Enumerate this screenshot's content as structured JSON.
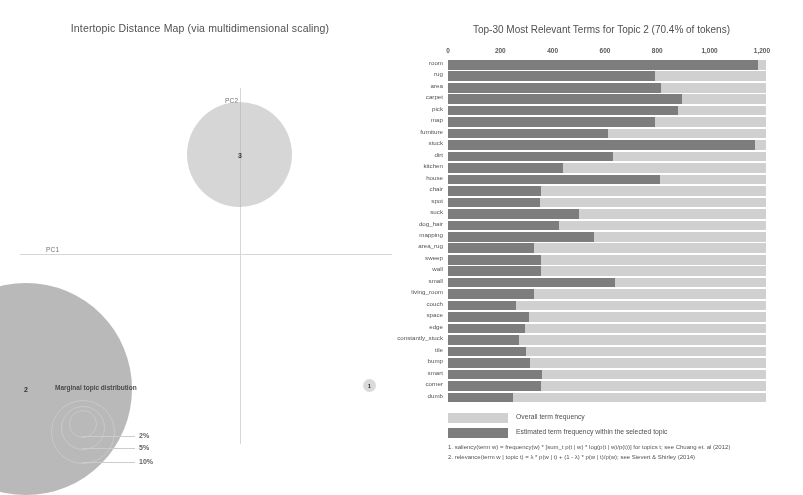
{
  "left_panel": {
    "title": "Intertopic Distance Map (via multidimensional scaling)",
    "axis_x_label": "PC1",
    "axis_y_label": "PC2",
    "bubbles": [
      {
        "id": "topic-3",
        "label": "3"
      },
      {
        "id": "topic-2",
        "label": "2"
      },
      {
        "id": "topic-1",
        "label": "1"
      }
    ],
    "marginal_legend": {
      "title": "Marginal topic distribution",
      "ticks": [
        "2%",
        "5%",
        "10%"
      ]
    }
  },
  "right_panel": {
    "title": "Top-30 Most Relevant Terms for Topic 2 (70.4% of tokens)",
    "legend": {
      "overall_label": "Overall term frequency",
      "estimated_label": "Estimated term frequency within the selected topic",
      "overall_color": "#d2d2d2",
      "estimated_color": "#7a7a7a"
    },
    "footnotes": [
      "1. saliency(term w) = frequency(w) * [sum_t p(t | w) * log(p(t | w)/p(t))] for topics t; see Chuang et. al (2012)",
      "2. relevance(term w | topic t) = λ * p(w | t) + (1 - λ) * p(w | t)/p(w); see Sievert & Shirley (2014)"
    ]
  },
  "chart_data": {
    "type": "bar",
    "title": "Top-30 Most Relevant Terms for Topic 2 (70.4% of tokens)",
    "xlabel": "",
    "ylabel": "",
    "orientation": "horizontal",
    "xlim": [
      0,
      1250
    ],
    "xticks": [
      0,
      200,
      400,
      600,
      800,
      1000,
      1200
    ],
    "xtick_labels": [
      "0",
      "200",
      "400",
      "600",
      "800",
      "1,000",
      "1,200"
    ],
    "grid": false,
    "legend_position": "bottom-left",
    "categories": [
      "room",
      "rug",
      "area",
      "carpet",
      "pick",
      "map",
      "furniture",
      "stuck",
      "dirt",
      "kitchen",
      "house",
      "chair",
      "spot",
      "suck",
      "dog_hair",
      "mapping",
      "area_rug",
      "sweep",
      "wall",
      "small",
      "living_room",
      "couch",
      "space",
      "edge",
      "constantly_stuck",
      "tile",
      "bump",
      "smart",
      "corner",
      "dumb"
    ],
    "series": [
      {
        "name": "Overall term frequency",
        "color": "#d2d2d2",
        "values": [
          1215,
          1215,
          1215,
          1215,
          1215,
          1215,
          1215,
          1215,
          1215,
          1215,
          1215,
          1215,
          1215,
          1215,
          1215,
          1215,
          1215,
          1215,
          1215,
          1215,
          1215,
          1215,
          1215,
          1215,
          1215,
          1215,
          1215,
          1215,
          1215,
          1215
        ]
      },
      {
        "name": "Estimated term frequency within the selected topic",
        "color": "#7a7a7a",
        "values": [
          1185,
          790,
          815,
          895,
          880,
          790,
          610,
          1175,
          630,
          440,
          810,
          355,
          350,
          500,
          425,
          560,
          330,
          355,
          355,
          640,
          330,
          260,
          310,
          295,
          270,
          300,
          315,
          360,
          355,
          250
        ]
      }
    ]
  }
}
